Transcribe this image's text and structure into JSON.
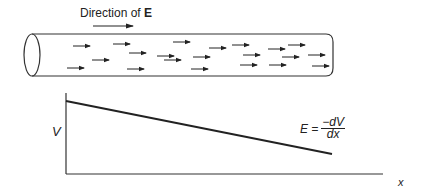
{
  "title": {
    "prefix": "Direction of ",
    "symbol": "E"
  },
  "conductor": {
    "shape": "cylinder",
    "field_arrows": [
      {
        "x1": 73,
        "y1": 46,
        "x2": 90,
        "y2": 46
      },
      {
        "x1": 113,
        "y1": 44,
        "x2": 130,
        "y2": 44
      },
      {
        "x1": 129,
        "y1": 53,
        "x2": 146,
        "y2": 53
      },
      {
        "x1": 92,
        "y1": 60,
        "x2": 109,
        "y2": 60
      },
      {
        "x1": 67,
        "y1": 68,
        "x2": 84,
        "y2": 68
      },
      {
        "x1": 127,
        "y1": 69,
        "x2": 144,
        "y2": 69
      },
      {
        "x1": 157,
        "y1": 56,
        "x2": 174,
        "y2": 56
      },
      {
        "x1": 164,
        "y1": 60,
        "x2": 181,
        "y2": 60
      },
      {
        "x1": 173,
        "y1": 42,
        "x2": 190,
        "y2": 42
      },
      {
        "x1": 193,
        "y1": 57,
        "x2": 210,
        "y2": 57
      },
      {
        "x1": 191,
        "y1": 69,
        "x2": 208,
        "y2": 69
      },
      {
        "x1": 209,
        "y1": 48,
        "x2": 226,
        "y2": 48
      },
      {
        "x1": 232,
        "y1": 45,
        "x2": 249,
        "y2": 45
      },
      {
        "x1": 243,
        "y1": 55,
        "x2": 260,
        "y2": 55
      },
      {
        "x1": 240,
        "y1": 65,
        "x2": 257,
        "y2": 65
      },
      {
        "x1": 268,
        "y1": 49,
        "x2": 285,
        "y2": 49
      },
      {
        "x1": 282,
        "y1": 57,
        "x2": 299,
        "y2": 57
      },
      {
        "x1": 269,
        "y1": 65,
        "x2": 286,
        "y2": 65
      },
      {
        "x1": 288,
        "y1": 45,
        "x2": 305,
        "y2": 45
      },
      {
        "x1": 308,
        "y1": 55,
        "x2": 325,
        "y2": 55
      },
      {
        "x1": 312,
        "y1": 66,
        "x2": 329,
        "y2": 66
      }
    ]
  },
  "graph": {
    "y_label": "V",
    "x_label": "x",
    "equation": {
      "lhs": "E =",
      "numerator": "−dV",
      "denominator": "dx"
    }
  },
  "chart_data": {
    "type": "line",
    "title": "",
    "xlabel": "x",
    "ylabel": "V",
    "series": [
      {
        "name": "V(x)",
        "x": [
          0,
          1
        ],
        "values": [
          0.9,
          0.25
        ]
      }
    ],
    "annotations": [
      "E = −dV/dx"
    ],
    "grid": false,
    "legend": "none"
  },
  "colors": {
    "stroke": "#222222",
    "background": "#ffffff"
  }
}
